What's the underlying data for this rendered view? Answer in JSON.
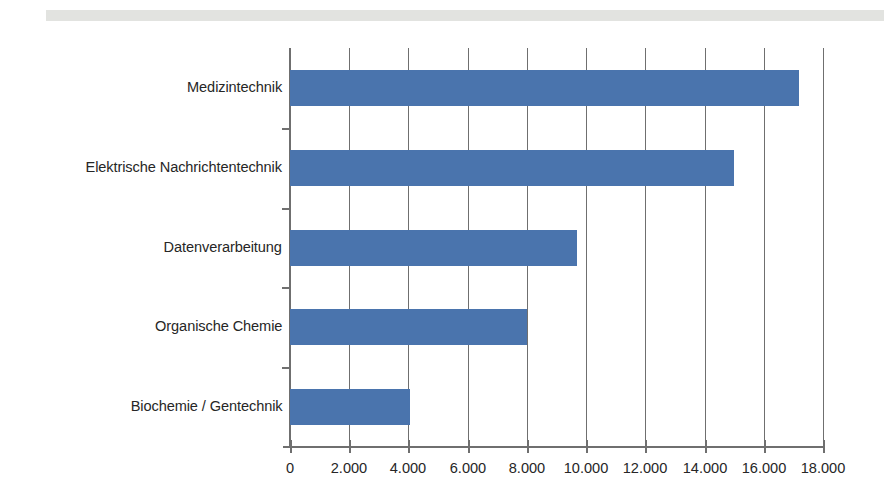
{
  "decor": {
    "top_band_color": "#e2e3e0"
  },
  "chart_data": {
    "type": "bar",
    "orientation": "horizontal",
    "title": "",
    "subtitle": "",
    "xlabel": "",
    "ylabel": "",
    "categories": [
      "Medizintechnik",
      "Elektrische Nachrichtentechnik",
      "Datenverarbeitung",
      "Organische Chemie",
      "Biochemie / Gentechnik"
    ],
    "values": [
      17200,
      15000,
      9700,
      8000,
      4050
    ],
    "xlim": [
      0,
      18000
    ],
    "xticks": [
      0,
      2000,
      4000,
      6000,
      8000,
      10000,
      12000,
      14000,
      16000,
      18000
    ],
    "xtick_labels": [
      "0",
      "2.000",
      "4.000",
      "6.000",
      "8.000",
      "10.000",
      "12.000",
      "14.000",
      "16.000",
      "18.000"
    ],
    "bar_color": "#4a74ad",
    "axis_color": "#6f6f6f",
    "grid": true,
    "grid_axis": "x",
    "legend": false,
    "legend_position": "none",
    "annotations": []
  }
}
